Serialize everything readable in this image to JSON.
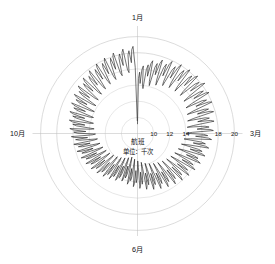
{
  "chart_data": {
    "type": "line",
    "projection": "polar",
    "title": "航班",
    "subtitle": "单位：千次",
    "xlabel": "",
    "ylabel": "航班",
    "unit": "千次",
    "grid": true,
    "legend": "none",
    "rlim": [
      8,
      21
    ],
    "r_ticks": [
      10,
      12,
      14,
      16,
      18,
      20
    ],
    "r_tick_labels": [
      "10",
      "12",
      "14",
      "16",
      "18",
      "20"
    ],
    "r_tick_visible": [
      "10",
      "12",
      "14",
      "18",
      "20"
    ],
    "grid_circles": [
      10,
      12,
      14,
      16,
      18,
      20
    ],
    "angular_labels": [
      {
        "label": "1月",
        "angle_deg": 0,
        "position": "top"
      },
      {
        "label": "3月",
        "angle_deg": 90,
        "position": "right"
      },
      {
        "label": "6月",
        "angle_deg": 180,
        "position": "bottom"
      },
      {
        "label": "10月",
        "angle_deg": 270,
        "position": "left"
      }
    ],
    "angular_start": "1月",
    "angular_direction": "clockwise",
    "series": [
      {
        "name": "航班",
        "color": "#1d1d1d",
        "n_points": 365,
        "description": "每日航班量，呈现明显的周周期锯齿波动",
        "values": [
          9.2,
          14.8,
          15.6,
          14.2,
          15.9,
          16.4,
          14.0,
          13.6,
          16.0,
          16.6,
          15.2,
          16.8,
          17.2,
          14.6,
          14.1,
          16.5,
          17.0,
          15.6,
          17.1,
          17.6,
          15.0,
          14.4,
          16.8,
          17.3,
          15.8,
          17.4,
          17.9,
          15.2,
          14.7,
          17.0,
          17.5,
          16.0,
          17.6,
          18.1,
          15.5,
          14.9,
          17.2,
          17.7,
          16.2,
          17.8,
          18.2,
          15.6,
          15.0,
          17.3,
          17.8,
          16.3,
          17.9,
          18.3,
          15.7,
          15.1,
          17.4,
          17.9,
          16.4,
          18.0,
          18.4,
          15.8,
          15.0,
          17.2,
          17.7,
          16.2,
          17.8,
          18.2,
          15.6,
          14.8,
          17.0,
          17.5,
          16.0,
          17.6,
          18.0,
          15.4,
          14.6,
          16.8,
          17.3,
          15.8,
          17.4,
          17.8,
          15.2,
          14.4,
          16.6,
          17.1,
          15.6,
          17.2,
          17.6,
          15.0,
          14.2,
          16.4,
          16.9,
          15.4,
          17.0,
          17.4,
          14.8,
          14.0,
          16.2,
          16.7,
          15.2,
          16.8,
          17.2,
          14.6,
          13.8,
          16.0,
          16.5,
          15.0,
          16.6,
          17.0,
          14.4,
          13.6,
          15.8,
          16.3,
          14.8,
          16.4,
          16.8,
          14.2,
          13.4,
          15.6,
          16.1,
          14.6,
          16.2,
          16.6,
          14.0,
          13.2,
          15.4,
          15.9,
          14.4,
          16.0,
          16.4,
          13.8,
          13.0,
          15.2,
          15.7,
          14.2,
          15.8,
          16.2,
          13.6,
          12.8,
          15.0,
          15.5,
          14.0,
          15.6,
          16.0,
          13.4,
          12.6,
          14.8,
          15.3,
          13.8,
          15.4,
          15.8,
          13.2,
          12.4,
          14.6,
          15.1,
          13.6,
          15.2,
          15.6,
          13.0,
          12.2,
          14.4,
          14.9,
          13.4,
          15.0,
          15.4,
          12.8,
          12.0,
          14.2,
          14.7,
          13.2,
          14.8,
          15.2,
          12.6,
          11.8,
          14.0,
          14.5,
          13.0,
          14.6,
          15.0,
          12.4,
          11.6,
          13.8,
          14.3,
          12.8,
          14.4,
          14.8,
          12.2,
          11.4,
          13.6,
          14.1,
          12.6,
          14.2,
          14.6,
          12.0,
          11.2,
          13.4,
          13.9,
          12.4,
          14.0,
          14.4,
          11.8,
          11.0,
          13.2,
          13.7,
          12.2,
          13.8,
          14.2,
          11.6,
          11.2,
          13.4,
          13.9,
          12.4,
          14.0,
          14.4,
          11.8,
          11.4,
          13.6,
          14.1,
          12.6,
          14.2,
          14.6,
          12.0,
          11.6,
          13.8,
          14.3,
          12.8,
          14.4,
          14.8,
          12.2,
          11.8,
          14.0,
          14.5,
          13.0,
          14.6,
          15.0,
          12.4,
          12.0,
          14.2,
          14.7,
          13.2,
          14.8,
          15.2,
          12.6,
          12.2,
          14.4,
          14.9,
          13.4,
          15.0,
          15.4,
          12.8,
          12.4,
          14.6,
          15.1,
          13.6,
          15.2,
          15.6,
          13.0,
          12.6,
          14.8,
          15.3,
          13.8,
          15.4,
          15.8,
          13.2,
          12.8,
          15.0,
          15.5,
          14.0,
          15.6,
          16.0,
          13.4,
          13.0,
          15.2,
          15.7,
          14.2,
          15.8,
          16.2,
          13.6,
          13.2,
          15.4,
          15.9,
          14.4,
          16.0,
          16.4,
          13.8,
          13.4,
          15.6,
          16.1,
          14.6,
          16.2,
          16.6,
          14.0,
          13.6,
          15.8,
          16.3,
          14.8,
          16.4,
          16.8,
          14.2,
          13.8,
          16.0,
          16.5,
          15.0,
          16.6,
          17.0,
          14.4,
          14.0,
          16.2,
          16.7,
          15.2,
          16.8,
          17.2,
          14.6,
          14.2,
          16.4,
          16.9,
          15.4,
          17.0,
          17.4,
          14.8,
          14.4,
          16.6,
          17.1,
          15.6,
          17.2,
          17.6,
          15.0,
          14.6,
          16.8,
          17.3,
          15.8,
          17.4,
          17.8,
          15.2,
          14.8,
          17.0,
          17.5,
          16.0,
          17.6,
          18.0,
          15.4,
          15.0,
          17.2,
          17.7,
          16.2,
          17.8,
          18.2,
          15.6,
          15.2,
          17.4,
          17.9,
          16.4,
          18.0,
          18.4,
          15.8,
          15.4,
          17.6,
          18.1,
          16.6,
          18.2,
          18.6,
          16.0,
          15.6,
          17.8,
          18.3,
          16.8,
          18.4,
          18.8,
          16.2,
          9.6
        ]
      }
    ]
  }
}
